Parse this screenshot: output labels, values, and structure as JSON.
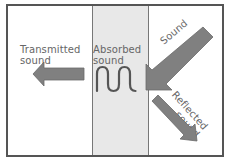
{
  "diagram": {
    "labels": {
      "transmitted": "Transmitted\nsound",
      "absorbed": "Absorbed\nsound",
      "incident": "Sound",
      "reflected": "Reflected\nsound"
    },
    "regions": [
      {
        "name": "transmission-side",
        "fill": "#ffffff"
      },
      {
        "name": "absorbing-material",
        "fill": "#e8e8e8"
      },
      {
        "name": "incident-side",
        "fill": "#ffffff"
      }
    ],
    "colors": {
      "arrow": "#808080",
      "arrow_edge": "#6a6a6a",
      "wave": "#555555",
      "frame": "#555555",
      "text": "#666666"
    }
  }
}
